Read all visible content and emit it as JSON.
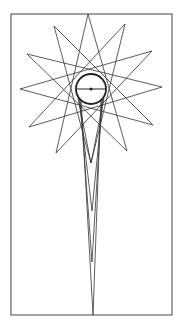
{
  "figure": {
    "colors": {
      "background": "#ffffff",
      "stroke": "#333333"
    },
    "frame": {
      "x": 11,
      "y": 14,
      "width": 161,
      "height": 301
    },
    "circle": {
      "cx": 91,
      "cy": 89,
      "r": 15,
      "diameter_line": true,
      "center_dot": true
    },
    "star_points": [
      [
        88,
        14
      ],
      [
        125,
        24
      ],
      [
        152,
        51
      ],
      [
        162,
        87
      ],
      [
        153,
        125
      ],
      [
        127,
        151
      ],
      [
        91,
        163
      ],
      [
        56,
        153
      ],
      [
        29,
        127
      ],
      [
        20,
        89
      ],
      [
        27,
        54
      ],
      [
        54,
        26
      ]
    ],
    "spike_tips": [
      [
        91,
        163
      ],
      [
        92,
        211
      ],
      [
        92,
        262
      ],
      [
        93,
        315
      ]
    ]
  }
}
